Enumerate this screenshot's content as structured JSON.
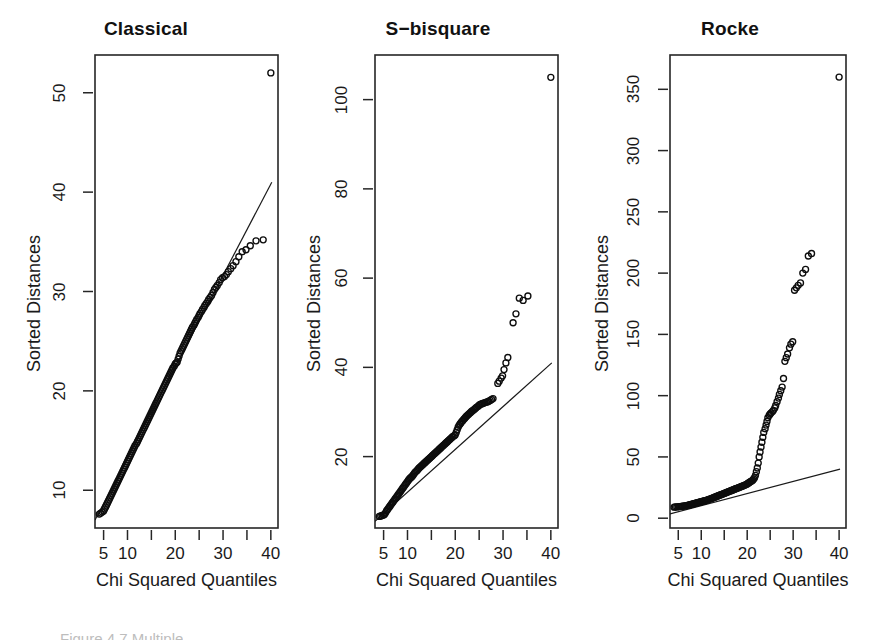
{
  "figure": {
    "width": 876,
    "height": 636,
    "background": "#ffffff",
    "foreground": "#1a1a1a",
    "caption_partial": "Figure 4.7  Multiple"
  },
  "chart_data": [
    {
      "type": "scatter",
      "title": "Classical",
      "xlabel": "Chi Squared Quantiles",
      "ylabel": "Sorted Distances",
      "xlim": [
        3.2,
        41.5
      ],
      "ylim": [
        6.2,
        53.8
      ],
      "grid": false,
      "legend": "none",
      "xticks": [
        5,
        10,
        15,
        20,
        25,
        30,
        35,
        40
      ],
      "xticklabels": [
        "5",
        "10",
        "",
        "20",
        "",
        "30",
        "",
        "40"
      ],
      "yticks": [
        10,
        20,
        30,
        40,
        50
      ],
      "yticklabels": [
        "10",
        "20",
        "30",
        "40",
        "50"
      ],
      "reference_line": {
        "x": [
          3.2,
          40.2
        ],
        "y": [
          7.0,
          41.0
        ]
      },
      "x": [
        4.1,
        4.4,
        4.7,
        5.0,
        5.2,
        5.4,
        5.6,
        5.8,
        6.0,
        6.2,
        6.4,
        6.6,
        6.8,
        7.0,
        7.2,
        7.4,
        7.6,
        7.8,
        8.0,
        8.2,
        8.4,
        8.6,
        8.8,
        9.0,
        9.2,
        9.4,
        9.6,
        9.8,
        10.0,
        10.2,
        10.4,
        10.6,
        10.8,
        11.0,
        11.2,
        11.4,
        11.6,
        11.9,
        12.1,
        12.3,
        12.5,
        12.7,
        12.9,
        13.1,
        13.3,
        13.5,
        13.7,
        13.9,
        14.1,
        14.3,
        14.5,
        14.7,
        14.9,
        15.1,
        15.3,
        15.5,
        15.7,
        15.9,
        16.1,
        16.3,
        16.5,
        16.7,
        16.9,
        17.1,
        17.3,
        17.5,
        17.7,
        17.9,
        18.1,
        18.3,
        18.5,
        18.7,
        18.9,
        19.1,
        19.3,
        19.5,
        19.8,
        20.0,
        20.2,
        20.4,
        20.6,
        20.8,
        21.0,
        21.2,
        21.4,
        21.6,
        21.8,
        22.0,
        22.2,
        22.4,
        22.6,
        22.8,
        23.0,
        23.2,
        23.4,
        23.6,
        23.9,
        24.1,
        24.3,
        24.5,
        24.8,
        25.0,
        25.2,
        25.5,
        25.7,
        26.0,
        26.2,
        26.5,
        26.8,
        27.0,
        27.3,
        27.6,
        27.9,
        28.2,
        28.5,
        28.8,
        29.2,
        29.5,
        29.9,
        30.3,
        30.7,
        31.1,
        31.6,
        32.1,
        32.7,
        33.3,
        34.0,
        34.8,
        35.7,
        36.9,
        38.4,
        40.0
      ],
      "y": [
        7.6,
        7.7,
        7.8,
        7.9,
        8.1,
        8.3,
        8.5,
        8.7,
        8.9,
        9.1,
        9.3,
        9.5,
        9.7,
        9.9,
        10.1,
        10.3,
        10.5,
        10.7,
        10.9,
        11.1,
        11.3,
        11.5,
        11.7,
        11.9,
        12.1,
        12.3,
        12.5,
        12.7,
        12.9,
        13.1,
        13.3,
        13.5,
        13.7,
        13.9,
        14.1,
        14.3,
        14.5,
        14.7,
        14.9,
        15.1,
        15.3,
        15.5,
        15.7,
        15.9,
        16.1,
        16.3,
        16.5,
        16.7,
        16.9,
        17.1,
        17.3,
        17.5,
        17.7,
        17.9,
        18.1,
        18.3,
        18.5,
        18.7,
        18.9,
        19.1,
        19.3,
        19.5,
        19.7,
        19.9,
        20.1,
        20.3,
        20.5,
        20.7,
        20.9,
        21.1,
        21.3,
        21.5,
        21.7,
        21.9,
        22.1,
        22.3,
        22.5,
        22.7,
        22.8,
        22.9,
        23.2,
        23.5,
        23.8,
        24.0,
        24.2,
        24.4,
        24.6,
        24.8,
        25.0,
        25.2,
        25.4,
        25.6,
        25.8,
        26.0,
        26.2,
        26.4,
        26.6,
        26.8,
        27.0,
        27.2,
        27.4,
        27.6,
        27.8,
        28.0,
        28.2,
        28.4,
        28.6,
        28.8,
        29.0,
        29.2,
        29.4,
        29.6,
        29.9,
        30.2,
        30.4,
        30.6,
        30.9,
        31.2,
        31.4,
        31.5,
        31.7,
        32.0,
        32.3,
        32.6,
        33.0,
        33.5,
        34.0,
        34.2,
        34.6,
        35.1,
        35.2,
        52.0
      ]
    },
    {
      "type": "scatter",
      "title": "S−bisquare",
      "xlabel": "Chi Squared Quantiles",
      "ylabel": "Sorted Distances",
      "xlim": [
        3.2,
        41.5
      ],
      "ylim": [
        4.0,
        110.0
      ],
      "grid": false,
      "legend": "none",
      "xticks": [
        5,
        10,
        15,
        20,
        25,
        30,
        35,
        40
      ],
      "xticklabels": [
        "5",
        "10",
        "",
        "20",
        "",
        "30",
        "",
        "40"
      ],
      "yticks": [
        20,
        40,
        60,
        80,
        100
      ],
      "yticklabels": [
        "20",
        "40",
        "60",
        "80",
        "100"
      ],
      "reference_line": {
        "x": [
          3.2,
          40.2
        ],
        "y": [
          5.5,
          41.0
        ]
      },
      "x": [
        4.1,
        4.4,
        4.7,
        5.0,
        5.2,
        5.4,
        5.6,
        5.8,
        6.0,
        6.2,
        6.4,
        6.6,
        6.8,
        7.0,
        7.2,
        7.4,
        7.6,
        7.8,
        8.0,
        8.2,
        8.4,
        8.6,
        8.8,
        9.0,
        9.2,
        9.4,
        9.6,
        9.8,
        10.0,
        10.2,
        10.4,
        10.6,
        10.8,
        11.0,
        11.2,
        11.4,
        11.6,
        11.9,
        12.1,
        12.3,
        12.5,
        12.7,
        12.9,
        13.1,
        13.3,
        13.5,
        13.7,
        13.9,
        14.1,
        14.3,
        14.5,
        14.7,
        14.9,
        15.1,
        15.3,
        15.5,
        15.7,
        15.9,
        16.1,
        16.3,
        16.5,
        16.7,
        16.9,
        17.1,
        17.3,
        17.5,
        17.7,
        17.9,
        18.1,
        18.3,
        18.5,
        18.7,
        18.9,
        19.1,
        19.3,
        19.5,
        19.8,
        20.0,
        20.2,
        20.4,
        20.6,
        20.8,
        21.0,
        21.2,
        21.4,
        21.6,
        21.8,
        22.0,
        22.2,
        22.4,
        22.6,
        22.8,
        23.0,
        23.2,
        23.4,
        23.6,
        23.9,
        24.1,
        24.3,
        24.5,
        24.8,
        25.0,
        25.2,
        25.5,
        25.7,
        26.0,
        26.2,
        26.5,
        26.8,
        27.0,
        27.3,
        27.6,
        27.9,
        28.9,
        29.2,
        29.6,
        29.9,
        30.2,
        30.6,
        31.0,
        32.1,
        32.7,
        33.4,
        34.2,
        35.2,
        40.0
      ],
      "y": [
        6.6,
        6.7,
        6.8,
        6.9,
        7.1,
        7.4,
        7.8,
        8.1,
        8.4,
        8.7,
        9.0,
        9.3,
        9.6,
        9.9,
        10.2,
        10.5,
        10.8,
        11.1,
        11.4,
        11.7,
        12.0,
        12.3,
        12.6,
        12.9,
        13.2,
        13.5,
        13.8,
        14.1,
        14.4,
        14.7,
        15.0,
        15.2,
        15.4,
        15.6,
        15.9,
        16.2,
        16.5,
        16.8,
        17.0,
        17.3,
        17.5,
        17.7,
        17.9,
        18.1,
        18.3,
        18.5,
        18.7,
        18.9,
        19.1,
        19.3,
        19.5,
        19.7,
        19.9,
        20.1,
        20.3,
        20.5,
        20.7,
        20.9,
        21.1,
        21.3,
        21.5,
        21.7,
        21.9,
        22.1,
        22.3,
        22.5,
        22.7,
        22.9,
        23.1,
        23.3,
        23.5,
        23.7,
        23.9,
        24.1,
        24.3,
        24.5,
        24.7,
        24.9,
        25.4,
        26.0,
        26.6,
        27.0,
        27.3,
        27.6,
        27.9,
        28.1,
        28.4,
        28.6,
        28.9,
        29.1,
        29.3,
        29.5,
        29.7,
        29.9,
        30.1,
        30.3,
        30.5,
        30.7,
        30.9,
        31.1,
        31.3,
        31.5,
        31.7,
        31.8,
        31.9,
        32.0,
        32.1,
        32.2,
        32.3,
        32.4,
        32.6,
        32.8,
        33.0,
        36.4,
        36.9,
        37.6,
        38.1,
        39.5,
        41.0,
        42.2,
        50.0,
        52.0,
        55.5,
        55.0,
        56.0,
        105.0
      ]
    },
    {
      "type": "scatter",
      "title": "Rocke",
      "xlabel": "Chi Squared Quantiles",
      "ylabel": "Sorted Distances",
      "xlim": [
        3.2,
        41.5
      ],
      "ylim": [
        -8.0,
        378.0
      ],
      "grid": false,
      "legend": "none",
      "xticks": [
        5,
        10,
        15,
        20,
        25,
        30,
        35,
        40
      ],
      "xticklabels": [
        "5",
        "10",
        "",
        "20",
        "",
        "30",
        "",
        "40"
      ],
      "yticks": [
        0,
        50,
        100,
        150,
        200,
        250,
        300,
        350
      ],
      "yticklabels": [
        "0",
        "50",
        "100",
        "150",
        "200",
        "250",
        "300",
        "350"
      ],
      "reference_line": {
        "x": [
          3.2,
          40.2
        ],
        "y": [
          3.5,
          40.0
        ]
      },
      "x": [
        4.1,
        4.4,
        4.7,
        5.0,
        5.2,
        5.4,
        5.6,
        5.8,
        6.0,
        6.2,
        6.4,
        6.6,
        6.8,
        7.0,
        7.2,
        7.4,
        7.6,
        7.8,
        8.0,
        8.2,
        8.4,
        8.6,
        8.8,
        9.0,
        9.2,
        9.4,
        9.6,
        9.8,
        10.0,
        10.2,
        10.4,
        10.6,
        10.8,
        11.0,
        11.2,
        11.4,
        11.6,
        11.9,
        12.1,
        12.3,
        12.5,
        12.7,
        12.9,
        13.1,
        13.3,
        13.5,
        13.7,
        13.9,
        14.1,
        14.3,
        14.5,
        14.7,
        14.9,
        15.1,
        15.3,
        15.5,
        15.7,
        15.9,
        16.1,
        16.3,
        16.5,
        16.7,
        16.9,
        17.1,
        17.3,
        17.5,
        17.7,
        17.9,
        18.1,
        18.3,
        18.5,
        18.7,
        18.9,
        19.1,
        19.3,
        19.5,
        19.8,
        20.0,
        20.2,
        20.4,
        20.6,
        20.8,
        21.0,
        21.2,
        21.4,
        21.6,
        21.8,
        22.0,
        22.2,
        22.4,
        22.6,
        22.8,
        23.0,
        23.2,
        23.4,
        23.6,
        23.9,
        24.1,
        24.3,
        24.5,
        24.8,
        25.0,
        25.2,
        25.5,
        25.7,
        26.0,
        26.2,
        26.5,
        26.8,
        27.0,
        27.3,
        27.6,
        27.9,
        28.2,
        28.5,
        28.8,
        29.2,
        29.5,
        29.9,
        30.3,
        30.7,
        31.1,
        31.6,
        32.1,
        32.7,
        33.3,
        34.0,
        40.0
      ],
      "y": [
        9.0,
        9.1,
        9.2,
        9.3,
        9.4,
        9.5,
        9.6,
        9.7,
        9.8,
        9.9,
        10.0,
        10.1,
        10.2,
        10.4,
        10.6,
        10.8,
        11.0,
        11.2,
        11.4,
        11.6,
        11.8,
        12.0,
        12.2,
        12.4,
        12.6,
        12.8,
        13.0,
        13.2,
        13.4,
        13.6,
        13.8,
        14.0,
        14.2,
        14.4,
        14.7,
        15.0,
        15.3,
        15.6,
        15.9,
        16.2,
        16.5,
        16.8,
        17.1,
        17.4,
        17.7,
        18.0,
        18.3,
        18.6,
        18.9,
        19.2,
        19.5,
        19.8,
        20.1,
        20.4,
        20.7,
        21.0,
        21.3,
        21.6,
        21.9,
        22.2,
        22.5,
        22.8,
        23.1,
        23.4,
        23.7,
        24.0,
        24.3,
        24.6,
        24.9,
        25.2,
        25.5,
        25.8,
        26.1,
        26.4,
        26.7,
        27.0,
        27.5,
        28.0,
        28.5,
        29.0,
        29.5,
        30.0,
        30.5,
        31.0,
        32.0,
        33.0,
        35.0,
        38.0,
        41.0,
        45.0,
        50.0,
        54.0,
        58.0,
        62.0,
        66.0,
        70.0,
        73.0,
        76.0,
        79.0,
        82.0,
        84.0,
        85.0,
        86.0,
        87.0,
        88.0,
        90.0,
        92.0,
        95.0,
        98.0,
        101.0,
        104.0,
        107.0,
        114.0,
        128.0,
        131.0,
        134.0,
        139.0,
        142.0,
        144.0,
        186.0,
        188.0,
        190.0,
        192.0,
        200.0,
        203.0,
        214.0,
        216.0,
        360.0
      ]
    }
  ]
}
